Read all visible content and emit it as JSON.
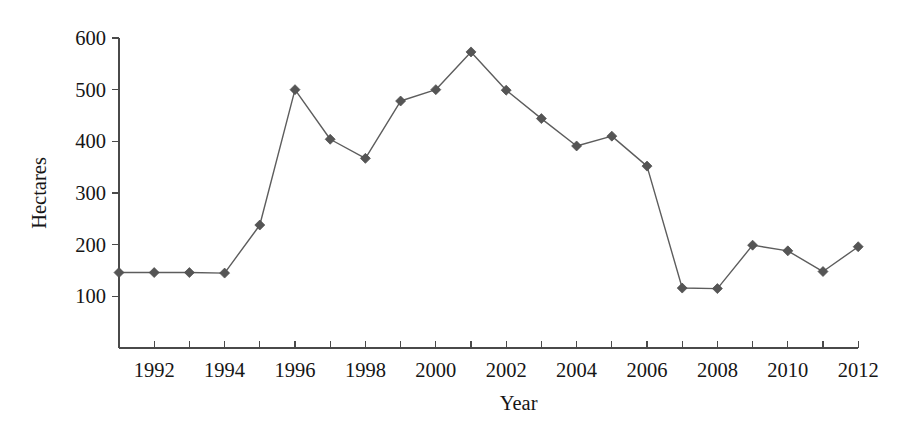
{
  "chart_data": {
    "type": "line",
    "title": "",
    "subtitle": "",
    "xlabel": "Year",
    "ylabel": "Hectares",
    "x": [
      1991,
      1992,
      1993,
      1994,
      1995,
      1996,
      1997,
      1998,
      1999,
      2000,
      2001,
      2002,
      2003,
      2004,
      2005,
      2006,
      2007,
      2008,
      2009,
      2010,
      2011,
      2012
    ],
    "values": [
      146,
      146,
      146,
      145,
      238,
      500,
      404,
      367,
      478,
      500,
      573,
      499,
      444,
      391,
      410,
      352,
      116,
      115,
      199,
      188,
      148,
      196
    ],
    "series": [
      {
        "name": "Hectares",
        "values": [
          146,
          146,
          146,
          145,
          238,
          500,
          404,
          367,
          478,
          500,
          573,
          499,
          444,
          391,
          410,
          352,
          116,
          115,
          199,
          188,
          148,
          196
        ]
      }
    ],
    "xlim": [
      1990.5,
      2012.5
    ],
    "ylim": [
      0,
      600
    ],
    "ytick_labels": [
      "100",
      "200",
      "300",
      "400",
      "500",
      "600"
    ],
    "ytick_values": [
      100,
      200,
      300,
      400,
      500,
      600
    ],
    "xtick_values": [
      1991,
      1992,
      1993,
      1994,
      1995,
      1996,
      1997,
      1998,
      1999,
      2000,
      2001,
      2002,
      2003,
      2004,
      2005,
      2006,
      2007,
      2008,
      2009,
      2010,
      2011,
      2012
    ],
    "xtick_labels": [
      "",
      "1992",
      "",
      "1994",
      "",
      "1996",
      "",
      "1998",
      "",
      "2000",
      "",
      "2002",
      "",
      "2004",
      "",
      "2006",
      "",
      "2008",
      "",
      "2010",
      "",
      "2012"
    ],
    "grid": false,
    "legend": false,
    "legend_position": "none",
    "marker": "diamond",
    "colors": {
      "line": "#5d5d5d",
      "marker": "#555555",
      "axis": "#4a4a4a",
      "text": "#161616",
      "background": "#ffffff"
    }
  }
}
